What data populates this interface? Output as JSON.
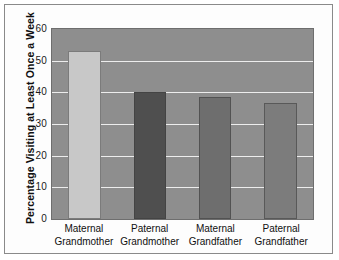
{
  "chart_data": {
    "type": "bar",
    "title": "",
    "xlabel": "",
    "ylabel": "Percentage Visiting at Least Once a Week",
    "categories": [
      "Maternal Grandmother",
      "Paternal Grandmother",
      "Maternal Grandfather",
      "Paternal Grandfather"
    ],
    "category_lines": [
      [
        "Maternal",
        "Grandmother"
      ],
      [
        "Paternal",
        "Grandmother"
      ],
      [
        "Maternal",
        "Grandfather"
      ],
      [
        "Paternal",
        "Grandfather"
      ]
    ],
    "values": [
      53,
      40,
      38.5,
      36.5
    ],
    "ylim": [
      0,
      60
    ],
    "yticks": [
      0,
      10,
      20,
      30,
      40,
      50,
      60
    ],
    "ytick_labels": [
      "0",
      "10",
      "20",
      "30",
      "40",
      "50",
      "60"
    ],
    "grid": true,
    "legend": "none",
    "bar_colors": [
      "#c8c8c8",
      "#4f4f4f",
      "#6e6e6e",
      "#7c7c7c"
    ],
    "plot_background": "#8e8e8e",
    "gridline_color": "#ededed",
    "figure_background": "#fdfdfd",
    "border_color": "#8a8a8a"
  }
}
